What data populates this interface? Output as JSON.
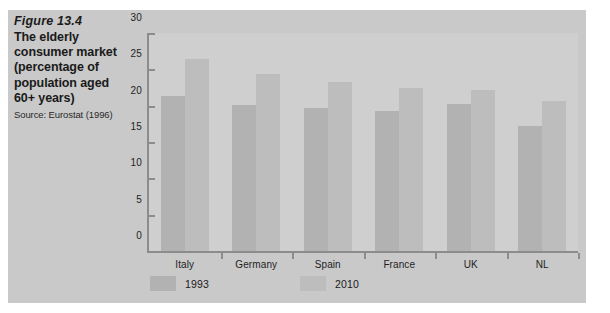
{
  "caption": {
    "figure_number": "Figure 13.4",
    "title": "The elderly consumer market (percentage of population aged 60+ years)",
    "source": "Source: Eurostat (1996)"
  },
  "colors": {
    "page_background": "#ffffff",
    "panel_background": "#c9c9c9",
    "plot_background": "#cfcfcf",
    "axis": "#8c8c8c",
    "series_1993": "#b2b2b2",
    "series_2010": "#bdbdbd",
    "text": "#1a1a1a"
  },
  "chart_data": {
    "type": "bar",
    "title": "The elderly consumer market (percentage of population aged 60+ years)",
    "xlabel": "",
    "ylabel": "",
    "ylim": [
      0,
      30
    ],
    "yticks": [
      0,
      5,
      10,
      15,
      20,
      25,
      30
    ],
    "ytick_labels": [
      "0",
      "5",
      "10",
      "15",
      "20",
      "25",
      "30"
    ],
    "grid": false,
    "legend_position": "bottom-left",
    "categories": [
      "Italy",
      "Germany",
      "Spain",
      "France",
      "UK",
      "NL"
    ],
    "series": [
      {
        "name": "1993",
        "values": [
          21.4,
          20.1,
          19.7,
          19.2,
          20.2,
          17.2
        ]
      },
      {
        "name": "2010",
        "values": [
          26.4,
          24.4,
          23.2,
          22.4,
          22.2,
          20.7
        ]
      }
    ]
  }
}
